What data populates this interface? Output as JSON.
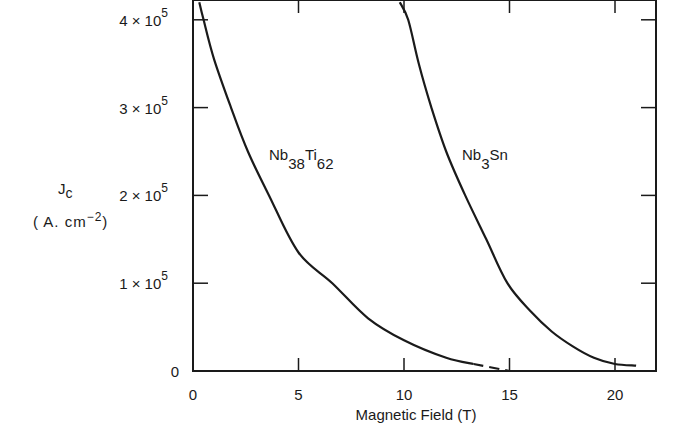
{
  "chart_data": {
    "type": "line",
    "title": "",
    "xlabel": "Magnetic Field (T)",
    "ylabel": "J_c (A.cm^-2)",
    "ylabel_main": "J",
    "ylabel_sub": "c",
    "ylabel_units_pre": "( A. cm",
    "ylabel_units_sup": "−2",
    "ylabel_units_post": ")",
    "xlim": [
      0,
      22
    ],
    "ylim": [
      0,
      420000
    ],
    "grid": false,
    "legend": "inline labels",
    "x_ticks": [
      {
        "value": 0,
        "label": "0"
      },
      {
        "value": 5,
        "label": "5"
      },
      {
        "value": 10,
        "label": "10"
      },
      {
        "value": 15,
        "label": "15"
      },
      {
        "value": 20,
        "label": "20"
      }
    ],
    "y_ticks": [
      {
        "value": 0,
        "mant": "0",
        "exp": ""
      },
      {
        "value": 100000,
        "mant": "1 × 10",
        "exp": "5"
      },
      {
        "value": 200000,
        "mant": "2 × 10",
        "exp": "5"
      },
      {
        "value": 300000,
        "mant": "3 × 10",
        "exp": "5"
      },
      {
        "value": 400000,
        "mant": "4 × 10",
        "exp": "5"
      }
    ],
    "series": [
      {
        "name": "Nb38Ti62",
        "label_parts": {
          "a": "Nb",
          "a_sub": "38",
          "b": "Ti",
          "b_sub": "62"
        },
        "x": [
          0.3,
          0.5,
          1.0,
          1.8,
          2.6,
          3.6,
          5.0,
          6.6,
          8.3,
          10.0,
          12.0,
          13.3
        ],
        "values": [
          420000,
          400000,
          355000,
          300000,
          250000,
          200000,
          135000,
          100000,
          60000,
          35000,
          15000,
          8000
        ],
        "extrapolated": {
          "x": [
            13.3,
            15.0
          ],
          "values": [
            8000,
            0
          ],
          "style": "dashed"
        }
      },
      {
        "name": "Nb3Sn",
        "label_parts": {
          "a": "Nb",
          "a_sub": "3",
          "b": "Sn",
          "b_sub": ""
        },
        "x": [
          9.8,
          10.2,
          10.7,
          11.3,
          12.0,
          12.9,
          13.9,
          14.9,
          16.0,
          17.0,
          18.0,
          19.0,
          20.0,
          21.0
        ],
        "values": [
          420000,
          400000,
          350000,
          300000,
          250000,
          200000,
          150000,
          100000,
          68000,
          45000,
          28000,
          15000,
          8000,
          6000
        ]
      }
    ]
  }
}
